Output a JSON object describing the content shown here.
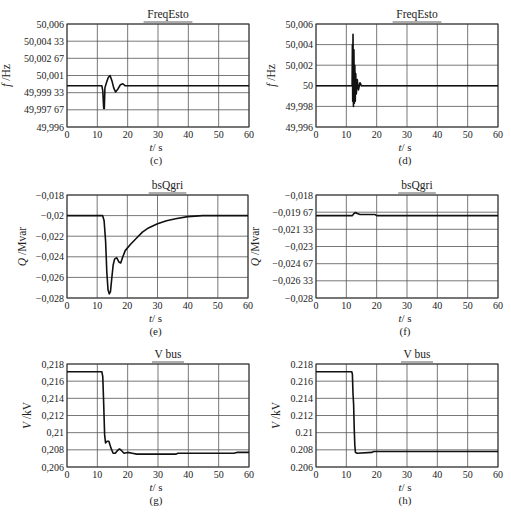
{
  "figure": {
    "width": 511,
    "height": 518,
    "line_color": "#111111",
    "grid_color": "#555555"
  },
  "chart_data": [
    {
      "id": "c",
      "panel_label": "(c)",
      "type": "line",
      "title": "FreqEsto",
      "xlabel": "t / s",
      "ylabel": "f /Hz",
      "frame": {
        "left": 67,
        "top": 24,
        "right": 249,
        "bottom": 127
      },
      "xlim": [
        0,
        60
      ],
      "ylim": [
        49.996,
        50.006
      ],
      "xticks": [
        0,
        10,
        20,
        30,
        40,
        50,
        60
      ],
      "xtick_labels": [
        "0",
        "10",
        "20",
        "30",
        "40",
        "50",
        "60"
      ],
      "yticks": [
        50.006,
        50.00433,
        50.00267,
        50.001,
        49.99933,
        49.99767,
        49.996
      ],
      "ytick_labels": [
        "50,006",
        "50,004 33",
        "50,002 67",
        "50,001",
        "49,999 33",
        "49,997 67",
        "49,996"
      ],
      "grid": true,
      "series": [
        {
          "name": "FreqEsto",
          "stroke_width": 1.6,
          "points": [
            [
              0,
              50.0
            ],
            [
              11.5,
              50.0
            ],
            [
              11.8,
              49.9995
            ],
            [
              12.1,
              49.9978
            ],
            [
              12.3,
              49.9978
            ],
            [
              12.5,
              49.9998
            ],
            [
              13.0,
              50.0003
            ],
            [
              13.6,
              50.0008
            ],
            [
              14.2,
              50.001
            ],
            [
              14.8,
              50.0005
            ],
            [
              15.4,
              49.9998
            ],
            [
              16.0,
              49.9994
            ],
            [
              16.8,
              49.9997
            ],
            [
              17.6,
              50.0001
            ],
            [
              18.4,
              50.0002
            ],
            [
              19.2,
              50.0
            ],
            [
              20,
              50.0
            ],
            [
              30,
              50.0
            ],
            [
              40,
              50.0
            ],
            [
              50,
              50.0
            ],
            [
              60,
              50.0
            ]
          ]
        }
      ]
    },
    {
      "id": "d",
      "panel_label": "(d)",
      "type": "line",
      "title": "FreqEsto",
      "xlabel": "t / s",
      "ylabel": "f /Hz",
      "frame": {
        "left": 316,
        "top": 24,
        "right": 498,
        "bottom": 127
      },
      "xlim": [
        0,
        60
      ],
      "ylim": [
        49.996,
        50.006
      ],
      "xticks": [
        0,
        10,
        20,
        30,
        40,
        50,
        60
      ],
      "xtick_labels": [
        "0",
        "10",
        "20",
        "30",
        "40",
        "50",
        "60"
      ],
      "yticks": [
        50.006,
        50.004,
        50.002,
        50.0,
        49.998,
        49.996
      ],
      "ytick_labels": [
        "50,006",
        "50,004",
        "50,002",
        "50",
        "49,998",
        "49,996"
      ],
      "grid": true,
      "series": [
        {
          "name": "FreqEsto",
          "stroke_width": 1.6,
          "points": [
            [
              0,
              50.0
            ],
            [
              11.9,
              50.0
            ],
            [
              12.0,
              50.004
            ],
            [
              12.1,
              49.9985
            ],
            [
              12.2,
              50.005
            ],
            [
              12.35,
              49.998
            ],
            [
              12.5,
              50.0035
            ],
            [
              12.65,
              49.9983
            ],
            [
              12.8,
              50.002
            ],
            [
              12.95,
              49.9985
            ],
            [
              13.1,
              50.0012
            ],
            [
              13.3,
              49.9992
            ],
            [
              13.6,
              50.0006
            ],
            [
              14.0,
              49.9996
            ],
            [
              14.5,
              50.0003
            ],
            [
              15.0,
              50.0
            ],
            [
              30,
              50.0
            ],
            [
              60,
              50.0
            ]
          ]
        }
      ]
    },
    {
      "id": "e",
      "panel_label": "(e)",
      "type": "line",
      "title": "bsQgri",
      "xlabel": "t / s",
      "ylabel": "Q /Mvar",
      "frame": {
        "left": 67,
        "top": 195,
        "right": 248,
        "bottom": 298
      },
      "xlim": [
        0,
        60
      ],
      "ylim": [
        -0.028,
        -0.018
      ],
      "xticks": [
        0,
        10,
        20,
        30,
        40,
        50,
        60
      ],
      "xtick_labels": [
        "0",
        "10",
        "20",
        "30",
        "40",
        "50",
        "60"
      ],
      "yticks": [
        -0.018,
        -0.02,
        -0.022,
        -0.024,
        -0.026,
        -0.028
      ],
      "ytick_labels": [
        "−0,018",
        "−0,02",
        "−0,022",
        "−0,024",
        "−0,026",
        "−0,028"
      ],
      "grid": true,
      "series": [
        {
          "name": "bsQgri",
          "stroke_width": 1.6,
          "points": [
            [
              0,
              -0.02
            ],
            [
              11.8,
              -0.02
            ],
            [
              12.3,
              -0.0205
            ],
            [
              12.8,
              -0.0225
            ],
            [
              13.2,
              -0.0255
            ],
            [
              13.6,
              -0.0272
            ],
            [
              14.0,
              -0.0276
            ],
            [
              14.4,
              -0.0274
            ],
            [
              14.8,
              -0.0262
            ],
            [
              15.3,
              -0.0248
            ],
            [
              15.8,
              -0.0242
            ],
            [
              16.5,
              -0.0241
            ],
            [
              17.2,
              -0.0245
            ],
            [
              17.8,
              -0.0246
            ],
            [
              18.5,
              -0.024
            ],
            [
              19.3,
              -0.0234
            ],
            [
              21,
              -0.0228
            ],
            [
              23,
              -0.0222
            ],
            [
              25,
              -0.0216
            ],
            [
              27,
              -0.0212
            ],
            [
              30,
              -0.0208
            ],
            [
              33,
              -0.0205
            ],
            [
              36,
              -0.0203
            ],
            [
              40,
              -0.0201
            ],
            [
              45,
              -0.02
            ],
            [
              50,
              -0.02
            ],
            [
              60,
              -0.02
            ]
          ]
        }
      ]
    },
    {
      "id": "f",
      "panel_label": "(f)",
      "type": "line",
      "title": "bsQgri",
      "xlabel": "t / s",
      "ylabel": "Q /Mvar",
      "frame": {
        "left": 316,
        "top": 195,
        "right": 498,
        "bottom": 298
      },
      "xlim": [
        0,
        60
      ],
      "ylim": [
        -0.028,
        -0.018
      ],
      "xticks": [
        0,
        10,
        20,
        30,
        40,
        50,
        60
      ],
      "xtick_labels": [
        "0",
        "10",
        "20",
        "30",
        "40",
        "50",
        "60"
      ],
      "yticks": [
        -0.018,
        -0.01967,
        -0.02133,
        -0.023,
        -0.02467,
        -0.02633,
        -0.028
      ],
      "ytick_labels": [
        "−0,018",
        "−0,019 67",
        "−0,021 33",
        "−0,023",
        "−0,024 67",
        "−0,026 33",
        "−0,028"
      ],
      "grid": true,
      "series": [
        {
          "name": "bsQgri",
          "stroke_width": 1.6,
          "points": [
            [
              0,
              -0.02
            ],
            [
              12.0,
              -0.02
            ],
            [
              12.5,
              -0.0198
            ],
            [
              13.0,
              -0.0197
            ],
            [
              13.6,
              -0.0198
            ],
            [
              14.5,
              -0.0199
            ],
            [
              16,
              -0.0199
            ],
            [
              19.5,
              -0.0199
            ],
            [
              20,
              -0.02
            ],
            [
              30,
              -0.02
            ],
            [
              60,
              -0.02
            ]
          ]
        }
      ]
    },
    {
      "id": "g",
      "panel_label": "(g)",
      "type": "line",
      "title": "V bus",
      "xlabel": "t / s",
      "ylabel": "V /kV",
      "frame": {
        "left": 67,
        "top": 364,
        "right": 249,
        "bottom": 467
      },
      "xlim": [
        0,
        60
      ],
      "ylim": [
        0.206,
        0.218
      ],
      "xticks": [
        0,
        10,
        20,
        30,
        40,
        50,
        60
      ],
      "xtick_labels": [
        "0",
        "10",
        "20",
        "30",
        "40",
        "50",
        "60"
      ],
      "yticks": [
        0.218,
        0.216,
        0.214,
        0.212,
        0.21,
        0.208,
        0.206
      ],
      "ytick_labels": [
        "0,218",
        "0,216",
        "0,214",
        "0,212",
        "0,21",
        "0,208",
        "0,206"
      ],
      "grid": true,
      "series": [
        {
          "name": "V bus",
          "stroke_width": 1.6,
          "points": [
            [
              0,
              0.2171
            ],
            [
              11.5,
              0.2171
            ],
            [
              11.8,
              0.2165
            ],
            [
              12.1,
              0.2133
            ],
            [
              12.4,
              0.2098
            ],
            [
              12.7,
              0.2088
            ],
            [
              13.2,
              0.209
            ],
            [
              13.8,
              0.209
            ],
            [
              14.5,
              0.2082
            ],
            [
              15.2,
              0.2076
            ],
            [
              15.9,
              0.2076
            ],
            [
              16.6,
              0.2079
            ],
            [
              17.3,
              0.2081
            ],
            [
              18.0,
              0.2079
            ],
            [
              18.8,
              0.2076
            ],
            [
              20,
              0.2077
            ],
            [
              21.5,
              0.2076
            ],
            [
              23,
              0.2075
            ],
            [
              30,
              0.2075
            ],
            [
              36,
              0.2075
            ],
            [
              36.5,
              0.2076
            ],
            [
              45,
              0.2076
            ],
            [
              55,
              0.2076
            ],
            [
              56,
              0.2077
            ],
            [
              60,
              0.2077
            ]
          ]
        }
      ]
    },
    {
      "id": "h",
      "panel_label": "(h)",
      "type": "line",
      "title": "V bus",
      "xlabel": "t / s",
      "ylabel": "V /kV",
      "frame": {
        "left": 316,
        "top": 364,
        "right": 498,
        "bottom": 467
      },
      "xlim": [
        0,
        60
      ],
      "ylim": [
        0.206,
        0.218
      ],
      "xticks": [
        0,
        10,
        20,
        30,
        40,
        50,
        60
      ],
      "xtick_labels": [
        "0",
        "10",
        "20",
        "30",
        "40",
        "50",
        "60"
      ],
      "yticks": [
        0.218,
        0.216,
        0.214,
        0.212,
        0.21,
        0.208,
        0.206
      ],
      "ytick_labels": [
        "0.218",
        "0.216",
        "0.214",
        "0.212",
        "0.21",
        "0.208",
        "0.206"
      ],
      "grid": true,
      "series": [
        {
          "name": "V bus",
          "stroke_width": 1.6,
          "points": [
            [
              0,
              0.2171
            ],
            [
              11.8,
              0.2171
            ],
            [
              12.0,
              0.2168
            ],
            [
              12.2,
              0.2145
            ],
            [
              12.4,
              0.2133
            ],
            [
              12.6,
              0.2105
            ],
            [
              12.8,
              0.2085
            ],
            [
              13.0,
              0.2077
            ],
            [
              13.5,
              0.2076
            ],
            [
              18.5,
              0.2077
            ],
            [
              19,
              0.2078
            ],
            [
              30,
              0.2078
            ],
            [
              60,
              0.2078
            ]
          ]
        }
      ]
    }
  ]
}
